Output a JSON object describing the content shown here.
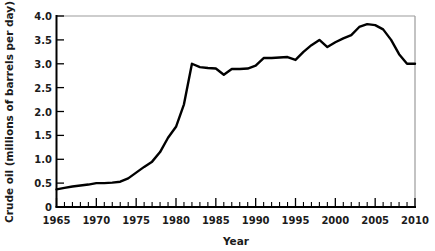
{
  "chart_data": {
    "type": "line",
    "title": "",
    "xlabel": "Year",
    "ylabel": "Crude oil (millions  of barrels per day)",
    "xlim": [
      1965,
      2010
    ],
    "ylim": [
      0,
      4.0
    ],
    "grid": false,
    "legend": null,
    "line_color": "#000000",
    "x_tick_labels": [
      "1965",
      "1970",
      "1975",
      "1980",
      "1985",
      "1990",
      "1995",
      "2000",
      "2005",
      "2010"
    ],
    "x_tick_values": [
      1965,
      1970,
      1975,
      1980,
      1985,
      1990,
      1995,
      2000,
      2005,
      2010
    ],
    "x_minor_tick_step": 1,
    "y_tick_labels": [
      "0",
      "0.5",
      "1.0",
      "1.5",
      "2.0",
      "2.5",
      "3.0",
      "3.5",
      "4.0"
    ],
    "y_tick_values": [
      0,
      0.5,
      1.0,
      1.5,
      2.0,
      2.5,
      3.0,
      3.5,
      4.0
    ],
    "series": [
      {
        "name": "Crude oil production",
        "x": [
          1965,
          1966,
          1967,
          1968,
          1969,
          1970,
          1971,
          1972,
          1973,
          1974,
          1975,
          1976,
          1977,
          1978,
          1979,
          1980,
          1981,
          1982,
          1983,
          1984,
          1985,
          1986,
          1987,
          1988,
          1989,
          1990,
          1991,
          1992,
          1993,
          1994,
          1995,
          1996,
          1997,
          1998,
          1999,
          2000,
          2001,
          2002,
          2003,
          2004,
          2005,
          2006,
          2007,
          2008,
          2009,
          2010
        ],
        "values": [
          0.37,
          0.4,
          0.43,
          0.45,
          0.47,
          0.5,
          0.5,
          0.51,
          0.53,
          0.6,
          0.72,
          0.84,
          0.95,
          1.15,
          1.45,
          1.68,
          2.15,
          3.0,
          2.93,
          2.91,
          2.9,
          2.77,
          2.89,
          2.89,
          2.9,
          2.96,
          3.12,
          3.12,
          3.13,
          3.14,
          3.08,
          3.25,
          3.39,
          3.5,
          3.35,
          3.45,
          3.53,
          3.6,
          3.77,
          3.83,
          3.81,
          3.72,
          3.5,
          3.2,
          3.0,
          3.0
        ]
      }
    ]
  },
  "axis_labels": {
    "x_axis_title": "Year",
    "y_axis_title": "Crude oil (millions  of barrels per day)"
  }
}
